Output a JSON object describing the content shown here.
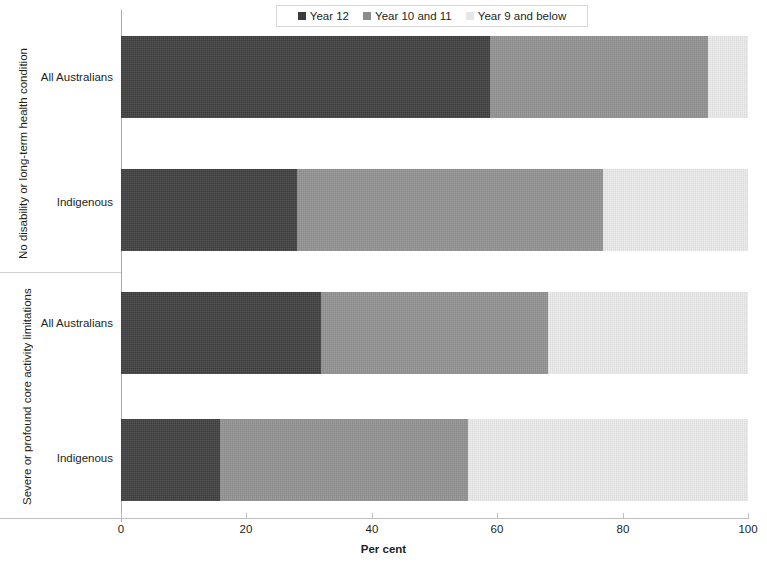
{
  "chart_data": {
    "type": "bar",
    "orientation": "horizontal",
    "stacked": true,
    "title": "",
    "xlabel": "Per cent",
    "ylabel": "",
    "xlim": [
      0,
      100
    ],
    "xticks": [
      0,
      20,
      40,
      60,
      80,
      100
    ],
    "grid": false,
    "legend_position": "top",
    "legend": [
      "Year 12",
      "Year 10 and 11",
      "Year 9 and below"
    ],
    "groups": [
      {
        "label": "No disability or long-term health condition",
        "categories": [
          "All Australians",
          "Indigenous"
        ]
      },
      {
        "label": "Severe or profound core activity limitations",
        "categories": [
          "All Australians",
          "Indigenous"
        ]
      }
    ],
    "categories": [
      "No disability or long-term health condition - All Australians",
      "No disability or long-term health condition - Indigenous",
      "Severe or profound core activity limitations - All Australians",
      "Severe or profound core activity limitations - Indigenous"
    ],
    "series": [
      {
        "name": "Year 12",
        "color": "#3f3f3f",
        "values": [
          58.9,
          28.1,
          31.9,
          15.8
        ]
      },
      {
        "name": "Year 10 and 11",
        "color": "#919191",
        "values": [
          34.7,
          48.8,
          36.2,
          39.5
        ]
      },
      {
        "name": "Year 9 and below",
        "color": "#e9e9e9",
        "values": [
          6.4,
          23.1,
          31.9,
          44.7
        ]
      }
    ]
  },
  "legend": {
    "items": [
      {
        "label": "Year 12"
      },
      {
        "label": "Year 10 and 11"
      },
      {
        "label": "Year 9 and below"
      }
    ]
  },
  "axis": {
    "x_title": "Per cent",
    "ticks": [
      {
        "label": "0"
      },
      {
        "label": "20"
      },
      {
        "label": "40"
      },
      {
        "label": "60"
      },
      {
        "label": "80"
      },
      {
        "label": "100"
      }
    ]
  },
  "groups": [
    {
      "title": "No disability or long-term health condition",
      "rows": [
        {
          "label": "All Australians"
        },
        {
          "label": "Indigenous"
        }
      ]
    },
    {
      "title": "Severe or profound core activity limitations",
      "rows": [
        {
          "label": "All Australians"
        },
        {
          "label": "Indigenous"
        }
      ]
    }
  ]
}
